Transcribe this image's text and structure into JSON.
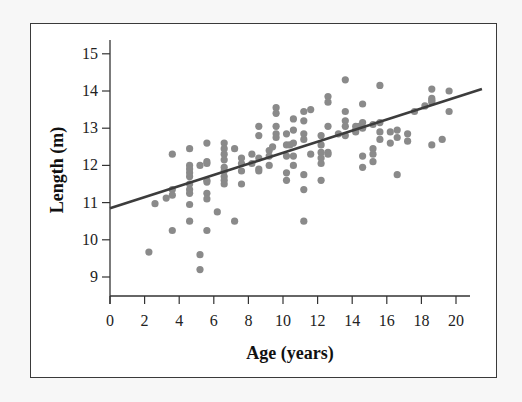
{
  "chart_data": {
    "type": "scatter",
    "title": "",
    "xlabel": "Age (years)",
    "ylabel": "Length (m)",
    "xlim": [
      0,
      21
    ],
    "ylim": [
      8.5,
      15.4
    ],
    "x_ticks": [
      0,
      2,
      4,
      6,
      8,
      10,
      12,
      14,
      16,
      18,
      20
    ],
    "y_ticks": [
      9,
      10,
      11,
      12,
      13,
      14,
      15
    ],
    "grid": false,
    "legend": null,
    "marker_color": "#8a8a8a",
    "line_color": "#3c3c3c",
    "regression_line": {
      "intercept": 10.85,
      "slope": 0.149,
      "x_range": [
        0,
        21.5
      ]
    },
    "series": [
      {
        "name": "observations",
        "points": [
          [
            2.25,
            9.67
          ],
          [
            2.6,
            10.97
          ],
          [
            3.25,
            11.12
          ],
          [
            3.6,
            12.3
          ],
          [
            3.6,
            11.35
          ],
          [
            3.6,
            11.2
          ],
          [
            3.6,
            10.25
          ],
          [
            4.6,
            12.45
          ],
          [
            4.6,
            12.0
          ],
          [
            4.6,
            11.9
          ],
          [
            4.6,
            11.8
          ],
          [
            4.6,
            11.7
          ],
          [
            4.6,
            11.5
          ],
          [
            4.6,
            11.35
          ],
          [
            4.6,
            11.25
          ],
          [
            4.6,
            10.95
          ],
          [
            4.6,
            10.5
          ],
          [
            5.2,
            12.0
          ],
          [
            5.2,
            9.6
          ],
          [
            5.2,
            9.2
          ],
          [
            5.6,
            12.6
          ],
          [
            5.6,
            12.1
          ],
          [
            5.6,
            12.05
          ],
          [
            5.6,
            11.6
          ],
          [
            5.6,
            11.55
          ],
          [
            5.6,
            11.25
          ],
          [
            5.6,
            11.1
          ],
          [
            5.6,
            10.25
          ],
          [
            6.2,
            10.75
          ],
          [
            6.6,
            12.6
          ],
          [
            6.6,
            12.45
          ],
          [
            6.6,
            12.3
          ],
          [
            6.6,
            12.15
          ],
          [
            6.6,
            11.95
          ],
          [
            6.6,
            11.85
          ],
          [
            6.6,
            11.7
          ],
          [
            6.6,
            11.6
          ],
          [
            6.6,
            11.5
          ],
          [
            7.2,
            12.45
          ],
          [
            7.2,
            10.5
          ],
          [
            7.6,
            12.2
          ],
          [
            7.6,
            12.05
          ],
          [
            7.6,
            11.85
          ],
          [
            7.6,
            11.5
          ],
          [
            8.2,
            12.3
          ],
          [
            8.2,
            12.05
          ],
          [
            8.6,
            13.05
          ],
          [
            8.6,
            12.8
          ],
          [
            8.6,
            12.2
          ],
          [
            8.6,
            11.9
          ],
          [
            8.6,
            11.85
          ],
          [
            9.2,
            12.4
          ],
          [
            9.2,
            12.25
          ],
          [
            9.2,
            12.0
          ],
          [
            9.4,
            12.5
          ],
          [
            9.6,
            13.55
          ],
          [
            9.6,
            13.4
          ],
          [
            9.6,
            13.05
          ],
          [
            9.6,
            12.85
          ],
          [
            9.6,
            12.75
          ],
          [
            10.2,
            12.85
          ],
          [
            10.2,
            12.55
          ],
          [
            10.2,
            12.25
          ],
          [
            10.2,
            11.8
          ],
          [
            10.2,
            11.6
          ],
          [
            10.4,
            12.55
          ],
          [
            10.6,
            13.25
          ],
          [
            10.6,
            12.95
          ],
          [
            10.6,
            12.6
          ],
          [
            10.6,
            12.25
          ],
          [
            10.6,
            12.0
          ],
          [
            11.2,
            13.45
          ],
          [
            11.2,
            13.2
          ],
          [
            11.2,
            12.85
          ],
          [
            11.2,
            12.7
          ],
          [
            11.2,
            11.75
          ],
          [
            11.2,
            11.35
          ],
          [
            11.2,
            10.5
          ],
          [
            11.6,
            13.5
          ],
          [
            11.6,
            12.3
          ],
          [
            12.2,
            12.8
          ],
          [
            12.2,
            12.55
          ],
          [
            12.2,
            12.35
          ],
          [
            12.2,
            12.2
          ],
          [
            12.2,
            12.05
          ],
          [
            12.2,
            11.6
          ],
          [
            12.6,
            13.85
          ],
          [
            12.6,
            13.7
          ],
          [
            12.6,
            13.05
          ],
          [
            12.6,
            12.35
          ],
          [
            12.6,
            12.3
          ],
          [
            13.2,
            12.85
          ],
          [
            13.6,
            14.3
          ],
          [
            13.6,
            13.45
          ],
          [
            13.6,
            13.2
          ],
          [
            13.6,
            13.05
          ],
          [
            13.6,
            12.8
          ],
          [
            14.2,
            13.05
          ],
          [
            14.2,
            12.95
          ],
          [
            14.2,
            12.9
          ],
          [
            14.4,
            13.05
          ],
          [
            14.6,
            13.65
          ],
          [
            14.6,
            13.15
          ],
          [
            14.6,
            13.0
          ],
          [
            14.6,
            12.25
          ],
          [
            14.6,
            11.95
          ],
          [
            15.2,
            13.1
          ],
          [
            15.2,
            12.45
          ],
          [
            15.2,
            12.3
          ],
          [
            15.2,
            12.1
          ],
          [
            15.6,
            14.15
          ],
          [
            15.6,
            13.15
          ],
          [
            15.6,
            12.9
          ],
          [
            15.6,
            12.7
          ],
          [
            16.2,
            12.9
          ],
          [
            16.2,
            12.6
          ],
          [
            16.6,
            12.95
          ],
          [
            16.6,
            12.75
          ],
          [
            16.6,
            11.75
          ],
          [
            17.2,
            12.85
          ],
          [
            17.2,
            12.65
          ],
          [
            17.6,
            13.45
          ],
          [
            18.2,
            13.6
          ],
          [
            18.6,
            14.05
          ],
          [
            18.6,
            13.8
          ],
          [
            18.6,
            13.75
          ],
          [
            18.6,
            13.7
          ],
          [
            18.6,
            12.55
          ],
          [
            19.2,
            12.7
          ],
          [
            19.6,
            14.0
          ],
          [
            19.6,
            13.45
          ]
        ]
      }
    ]
  }
}
